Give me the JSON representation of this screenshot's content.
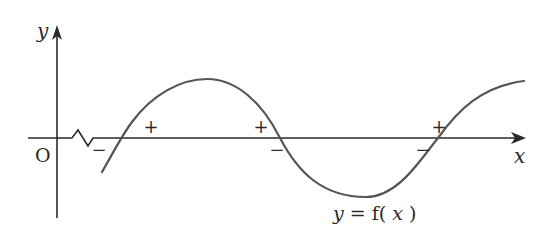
{
  "diagram": {
    "type": "function-graph",
    "axes": {
      "x_label": "x",
      "y_label": "y",
      "origin_label": "O",
      "x_axis_break": true
    },
    "curve_label": "y = f(x)",
    "curve_label_parts": {
      "lhs": "y",
      "eq": "=",
      "f": "f(",
      "var": "x",
      "close": ")"
    },
    "roots": [
      {
        "id": "root-1",
        "left_sign": "−",
        "right_sign": "+",
        "direction": "increasing"
      },
      {
        "id": "root-2",
        "left_sign": "+",
        "right_sign": "−",
        "direction": "decreasing"
      },
      {
        "id": "root-3",
        "left_sign": "−",
        "right_sign": "+",
        "direction": "increasing"
      }
    ],
    "features": {
      "maximum": "between root-1 and root-2",
      "minimum": "between root-2 and root-3"
    },
    "colors": {
      "axis": "#2a2a2a",
      "curve": "#555555",
      "text": "#2a2a2a",
      "background": "#ffffff"
    }
  }
}
